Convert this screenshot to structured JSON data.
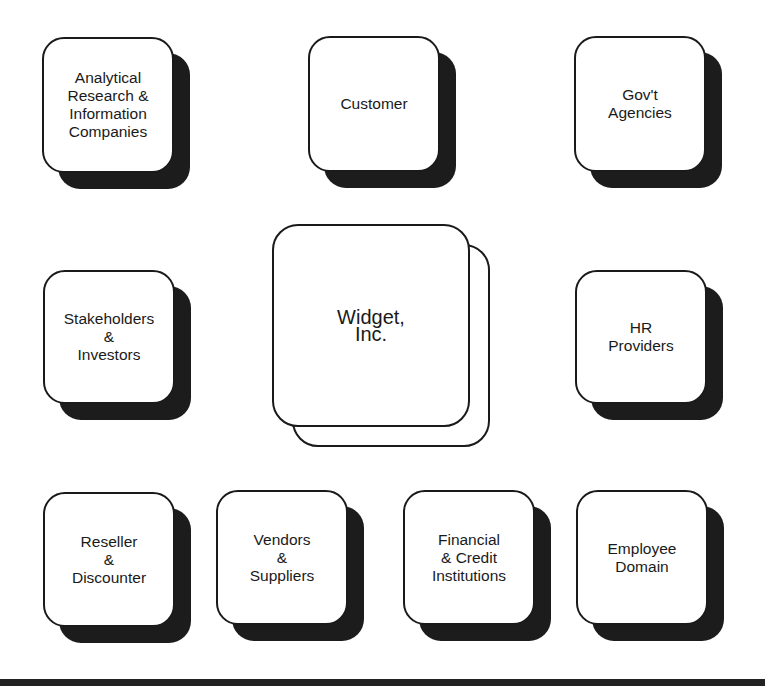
{
  "diagram": {
    "center": {
      "label": "Widget,\nInc.",
      "x": 272,
      "y": 224,
      "w": 198,
      "h": 203,
      "back_offset": 20
    },
    "nodes": [
      {
        "id": "analytical-research",
        "label": "Analytical\nResearch &\nInformation\nCompanies",
        "x": 42,
        "y": 37,
        "w": 132,
        "h": 136
      },
      {
        "id": "customer",
        "label": "Customer",
        "x": 308,
        "y": 36,
        "w": 132,
        "h": 136
      },
      {
        "id": "govt-agencies",
        "label": "Gov't\nAgencies",
        "x": 574,
        "y": 36,
        "w": 132,
        "h": 136
      },
      {
        "id": "stakeholders-investors",
        "label": "Stakeholders\n&\nInvestors",
        "x": 43,
        "y": 270,
        "w": 132,
        "h": 134
      },
      {
        "id": "hr-providers",
        "label": "HR\nProviders",
        "x": 575,
        "y": 270,
        "w": 132,
        "h": 134
      },
      {
        "id": "reseller-discounter",
        "label": "Reseller\n&\nDiscounter",
        "x": 43,
        "y": 492,
        "w": 132,
        "h": 135
      },
      {
        "id": "vendors-suppliers",
        "label": "Vendors\n&\nSuppliers",
        "x": 216,
        "y": 490,
        "w": 132,
        "h": 135
      },
      {
        "id": "financial-credit",
        "label": "Financial\n& Credit\nInstitutions",
        "x": 403,
        "y": 490,
        "w": 132,
        "h": 135
      },
      {
        "id": "employee-domain",
        "label": "Employee\nDomain",
        "x": 576,
        "y": 490,
        "w": 132,
        "h": 135
      }
    ],
    "shadow_offset": 16,
    "colors": {
      "outline": "#1a1a1a",
      "shadow": "#1c1c1c",
      "fill": "#ffffff",
      "rule": "#222222"
    }
  }
}
